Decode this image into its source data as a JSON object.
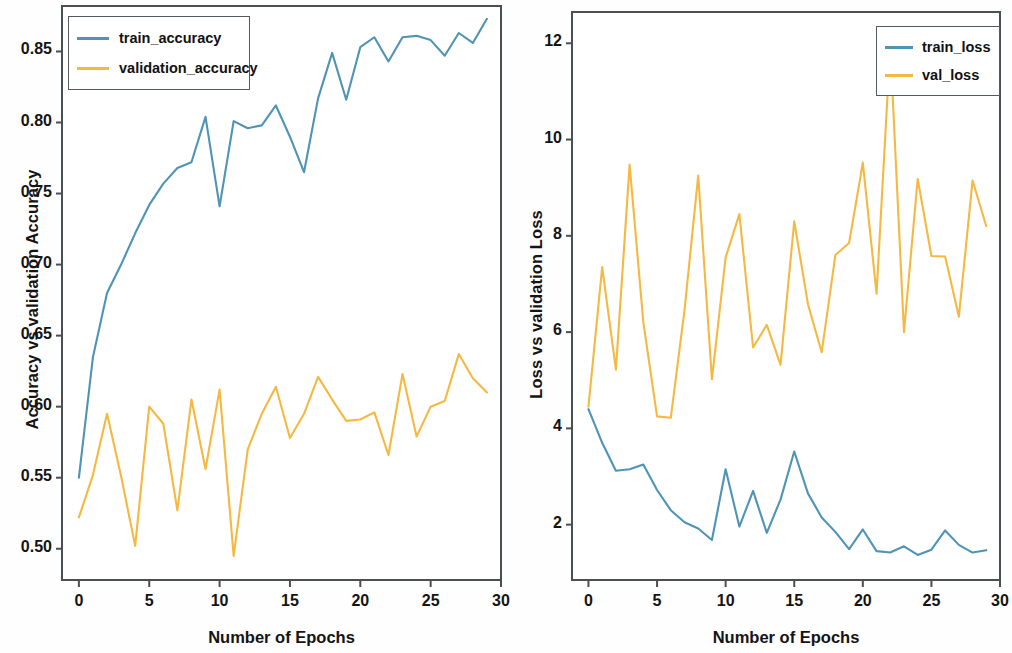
{
  "chart_data": [
    {
      "type": "line",
      "panel": "left",
      "title": "",
      "xlabel": "Number of Epochs",
      "ylabel": "Accuracy  vs validation Accuracy",
      "xlim": [
        -1.2,
        30
      ],
      "ylim": [
        0.478,
        0.882
      ],
      "xticks": [
        0,
        5,
        10,
        15,
        20,
        25,
        30
      ],
      "xticklabels": [
        "0",
        "5",
        "10",
        "15",
        "20",
        "25",
        "30"
      ],
      "yticks": [
        0.5,
        0.55,
        0.6,
        0.65,
        0.7,
        0.75,
        0.8,
        0.85
      ],
      "yticklabels": [
        "0.50",
        "0.55",
        "0.60",
        "0.65",
        "0.70",
        "0.75",
        "0.80",
        "0.85"
      ],
      "grid": false,
      "legend_position": "upper left",
      "x": [
        0,
        1,
        2,
        3,
        4,
        5,
        6,
        7,
        8,
        9,
        10,
        11,
        12,
        13,
        14,
        15,
        16,
        17,
        18,
        19,
        20,
        21,
        22,
        23,
        24,
        25,
        26,
        27,
        28,
        29
      ],
      "series": [
        {
          "name": "train_accuracy",
          "color": "#4f94b5",
          "values": [
            0.55,
            0.635,
            0.68,
            0.7,
            0.722,
            0.742,
            0.757,
            0.768,
            0.772,
            0.804,
            0.741,
            0.801,
            0.796,
            0.798,
            0.812,
            0.79,
            0.765,
            0.817,
            0.849,
            0.816,
            0.853,
            0.86,
            0.843,
            0.86,
            0.861,
            0.858,
            0.847,
            0.863,
            0.856,
            0.873,
            0.867
          ]
        },
        {
          "name": "validation_accuracy",
          "color": "#f5b942",
          "values": [
            0.522,
            0.552,
            0.595,
            0.551,
            0.502,
            0.6,
            0.588,
            0.527,
            0.605,
            0.556,
            0.612,
            0.495,
            0.57,
            0.595,
            0.614,
            0.578,
            0.595,
            0.621,
            0.605,
            0.59,
            0.591,
            0.596,
            0.566,
            0.623,
            0.579,
            0.6,
            0.604,
            0.637,
            0.62,
            0.61
          ]
        }
      ]
    },
    {
      "type": "line",
      "panel": "right",
      "title": "",
      "xlabel": "Number of Epochs",
      "ylabel": "Loss vs validation Loss",
      "xlim": [
        -1.2,
        30
      ],
      "ylim": [
        0.85,
        12.65
      ],
      "xticks": [
        0,
        5,
        10,
        15,
        20,
        25,
        30
      ],
      "xticklabels": [
        "0",
        "5",
        "10",
        "15",
        "20",
        "25",
        "30"
      ],
      "yticks": [
        2,
        4,
        6,
        8,
        10,
        12
      ],
      "yticklabels": [
        "2",
        "4",
        "6",
        "8",
        "10",
        "12"
      ],
      "grid": false,
      "legend_position": "upper right",
      "x": [
        0,
        1,
        2,
        3,
        4,
        5,
        6,
        7,
        8,
        9,
        10,
        11,
        12,
        13,
        14,
        15,
        16,
        17,
        18,
        19,
        20,
        21,
        22,
        23,
        24,
        25,
        26,
        27,
        28,
        29
      ],
      "series": [
        {
          "name": "train_loss",
          "color": "#4f94b5",
          "values": [
            4.4,
            3.7,
            3.12,
            3.15,
            3.25,
            2.72,
            2.3,
            2.05,
            1.92,
            1.68,
            3.15,
            1.96,
            2.7,
            1.83,
            2.52,
            3.52,
            2.65,
            2.15,
            1.85,
            1.49,
            1.9,
            1.45,
            1.42,
            1.55,
            1.37,
            1.48,
            1.88,
            1.58,
            1.42,
            1.47,
            1.32,
            1.45
          ]
        },
        {
          "name": "val_loss",
          "color": "#f5b942",
          "values": [
            4.45,
            7.35,
            5.22,
            9.48,
            6.2,
            4.25,
            4.22,
            6.45,
            9.25,
            5.02,
            7.55,
            8.45,
            5.68,
            6.15,
            5.32,
            8.3,
            6.58,
            5.58,
            7.6,
            7.85,
            9.52,
            6.8,
            11.95,
            6.0,
            9.18,
            7.58,
            7.57,
            6.32,
            9.15,
            8.2
          ]
        }
      ]
    }
  ],
  "left_chart": {
    "ylabel": "Accuracy  vs validation Accuracy",
    "xlabel": "Number of Epochs",
    "legend": {
      "items": [
        {
          "label": "train_accuracy",
          "color": "#4f94b5"
        },
        {
          "label": "validation_accuracy",
          "color": "#f5b942"
        }
      ]
    },
    "yticklabels": [
      "0.85",
      "0.80",
      "0.75",
      "0.70",
      "0.65",
      "0.60",
      "0.55",
      "0.50"
    ],
    "xticklabels": [
      "0",
      "5",
      "10",
      "15",
      "20",
      "25",
      "30"
    ]
  },
  "right_chart": {
    "ylabel": "Loss vs validation Loss",
    "xlabel": "Number of Epochs",
    "legend": {
      "items": [
        {
          "label": "train_loss",
          "color": "#4f94b5"
        },
        {
          "label": "val_loss",
          "color": "#f5b942"
        }
      ]
    },
    "yticklabels": [
      "12",
      "10",
      "8",
      "6",
      "4",
      "2"
    ],
    "xticklabels": [
      "0",
      "5",
      "10",
      "15",
      "20",
      "25",
      "30"
    ]
  }
}
